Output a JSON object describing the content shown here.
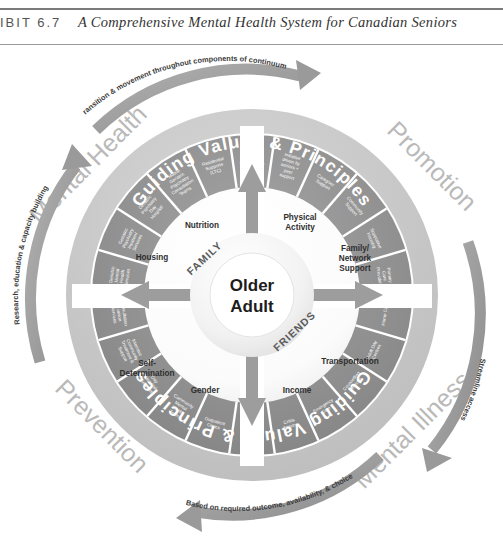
{
  "header": {
    "exhibit_label": "IBIT 6.7",
    "title": "A Comprehensive Mental Health System for Canadian Seniors"
  },
  "diagram": {
    "core": {
      "line1": "Older",
      "line2": "Adult"
    },
    "core_rings": [
      {
        "name": "family",
        "label": "FAMILY"
      },
      {
        "name": "friends",
        "label": "FRIENDS"
      }
    ],
    "determinants": [
      {
        "name": "physical-activity",
        "label": "Physical\nActivity"
      },
      {
        "name": "family-network-support",
        "label": "Family/\nNetwork\nSupport"
      },
      {
        "name": "transportation",
        "label": "Transportation"
      },
      {
        "name": "income",
        "label": "Income"
      },
      {
        "name": "gender",
        "label": "Gender"
      },
      {
        "name": "self-determination",
        "label": "Self-\nDetermination"
      },
      {
        "name": "housing",
        "label": "Housing"
      },
      {
        "name": "nutrition",
        "label": "Nutrition"
      }
    ],
    "ring_band_label_top": "Guiding Values & Principles",
    "ring_band_label_bottom": "Guiding Values & Principles",
    "services": [
      "Specialized Support, Emergency Response & Crisis Services",
      "Initiative driven by seniors + peer support",
      "Caregiver Support",
      "Community Support",
      "Supportive Housing",
      "Primary Care Providers",
      "Home Care",
      "Adult Day Centres",
      "Counselling Services",
      "Emergency Care",
      "Crisis Service",
      "Inpatient Mental Health Services",
      "Outpatient Clinics",
      "Community Mental Health Teams",
      "Day Hospital Services",
      "Intensive Community Treatment & Support",
      "Consultation Liaison Services",
      "Geriatric Mental Health Services",
      "Geriatric Psychiatry Inpatient Services",
      "Geriatric Psychiatry Day Hospital",
      "Mobile Geriatric Psychiatry Consultation Teams",
      "Residential Supports (LTC)"
    ],
    "corner_labels": [
      {
        "name": "mental-health",
        "label": "Mental Health"
      },
      {
        "name": "promotion",
        "label": "Promotion"
      },
      {
        "name": "mental-illness",
        "label": "Mental Illness"
      },
      {
        "name": "prevention",
        "label": "Prevention"
      }
    ],
    "flow_arrows": [
      {
        "name": "transition-arrow",
        "label": "Transition & movement throughout components of continuum"
      },
      {
        "name": "streamline-access-arrow",
        "label": "Streamline access"
      },
      {
        "name": "outcome-arrow",
        "label": "Based on required outcome, availability, & choice"
      },
      {
        "name": "research-arrow",
        "label": "Research, education & capacity building"
      }
    ]
  },
  "colors": {
    "band_dark": "#8e8e8e",
    "band_mid": "#a8a8a8",
    "band_light": "#c9c9c9",
    "segment": "#8c8c8c",
    "arrow": "#9a9a9a",
    "corner_text": "#b9b9b9",
    "core": "#efefef"
  }
}
